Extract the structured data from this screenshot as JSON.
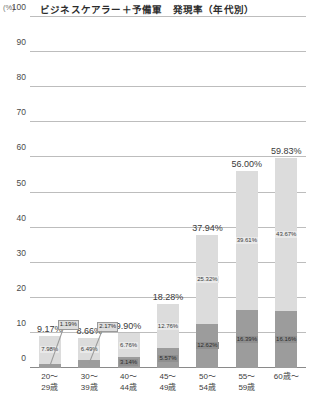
{
  "chart_data": {
    "type": "bar",
    "title": "ビジネスケアラー＋予備軍　発現率（年代別）",
    "unit_label": "(%)",
    "xlabel": "",
    "ylabel": "",
    "ylim": [
      0,
      100
    ],
    "ytick_step": 10,
    "grid": true,
    "legend_position": "none",
    "stacked": true,
    "categories": [
      "20～\n29歳",
      "30～\n39歳",
      "40～\n44歳",
      "45～\n49歳",
      "50～\n54歳",
      "55～\n59歳",
      "60歳～"
    ],
    "category_lines": [
      [
        "20～",
        "29歳"
      ],
      [
        "30～",
        "39歳"
      ],
      [
        "40～",
        "44歳"
      ],
      [
        "45～",
        "49歳"
      ],
      [
        "50～",
        "54歳"
      ],
      [
        "55～",
        "59歳"
      ],
      [
        "60歳～",
        ""
      ]
    ],
    "series": [
      {
        "name": "ビジネスケアラー",
        "color": "#9c9c9c",
        "values": [
          1.19,
          2.17,
          3.14,
          5.57,
          12.62,
          16.39,
          16.16
        ]
      },
      {
        "name": "予備軍",
        "color": "#dcdcdc",
        "values": [
          7.98,
          6.49,
          6.76,
          12.76,
          25.32,
          39.61,
          43.67
        ]
      }
    ],
    "totals": [
      9.17,
      8.66,
      9.9,
      18.28,
      37.94,
      56.0,
      59.83
    ],
    "total_labels": [
      "9.17%",
      "8.66%",
      "9.90%",
      "18.28%",
      "37.94%",
      "56.00%",
      "59.83%"
    ],
    "top_segment_labels": [
      "7.98%",
      "6.49%",
      "6.76%",
      "12.76%",
      "25.32%",
      "39.61%",
      "43.67%"
    ],
    "bottom_segment_labels": [
      "1.19%",
      "2.17%",
      "3.14%",
      "5.57%",
      "12.62%",
      "16.39%",
      "16.16%"
    ],
    "ytick_labels": [
      "0",
      "10",
      "20",
      "30",
      "40",
      "50",
      "60",
      "70",
      "80",
      "90",
      "100"
    ],
    "colors": {
      "top_segment": "#dcdcdc",
      "bottom_segment": "#9c9c9c",
      "grid": "#bdbdbd",
      "axis": "#8a8a8a",
      "text": "#3b3b3b"
    }
  }
}
